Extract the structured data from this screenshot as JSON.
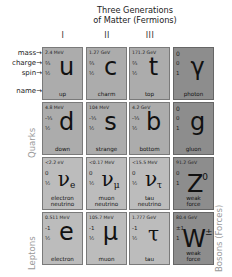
{
  "title": {
    "line1": "Three Generations",
    "line2": "of Matter (Fermions)"
  },
  "generations": [
    "I",
    "II",
    "III"
  ],
  "legend": {
    "mass": "mass→",
    "charge": "charge→",
    "spin": "spin→",
    "name": "name→"
  },
  "side_labels": {
    "quarks": "Quarks",
    "leptons": "Leptons",
    "bosons": "Bosons (Forces)"
  },
  "colors": {
    "quark_fill": "#acacac",
    "lepton_fill": "#bcbcbc",
    "boson_fill": "#8d8d8d",
    "side_label": "#9a9a9a"
  },
  "particles": {
    "row1": [
      {
        "mass": "2.4 MeV",
        "charge": "⅔",
        "spin": "½",
        "symbol": "u",
        "name1": "up",
        "name2": ""
      },
      {
        "mass": "1.27 GeV",
        "charge": "⅔",
        "spin": "½",
        "symbol": "c",
        "name1": "charm",
        "name2": ""
      },
      {
        "mass": "171.2 GeV",
        "charge": "⅔",
        "spin": "½",
        "symbol": "t",
        "name1": "top",
        "name2": ""
      },
      {
        "mass": "0",
        "charge": "0",
        "spin": "1",
        "symbol": "γ",
        "name1": "photon",
        "name2": ""
      }
    ],
    "row2": [
      {
        "mass": "4.8 MeV",
        "charge": "-⅓",
        "spin": "½",
        "symbol": "d",
        "name1": "down",
        "name2": ""
      },
      {
        "mass": "104 MeV",
        "charge": "-⅓",
        "spin": "½",
        "symbol": "s",
        "name1": "strange",
        "name2": ""
      },
      {
        "mass": "4.2 GeV",
        "charge": "-⅓",
        "spin": "½",
        "symbol": "b",
        "name1": "bottom",
        "name2": ""
      },
      {
        "mass": "0",
        "charge": "0",
        "spin": "1",
        "symbol": "g",
        "name1": "gluon",
        "name2": ""
      }
    ],
    "row3": [
      {
        "mass": "<2.2 eV",
        "charge": "0",
        "spin": "½",
        "symbol": "ν",
        "sub": "e",
        "name1": "electron",
        "name2": "neutrino"
      },
      {
        "mass": "<0.17 MeV",
        "charge": "0",
        "spin": "½",
        "symbol": "ν",
        "sub": "μ",
        "name1": "muon",
        "name2": "neutrino"
      },
      {
        "mass": "<15.5 MeV",
        "charge": "0",
        "spin": "½",
        "symbol": "ν",
        "sub": "τ",
        "name1": "tau",
        "name2": "neutrino"
      },
      {
        "mass": "91.2 GeV",
        "charge": "0",
        "spin": "1",
        "symbol": "Z",
        "sup": "0",
        "name1": "weak",
        "name2": "force"
      }
    ],
    "row4": [
      {
        "mass": "0.511 MeV",
        "charge": "-1",
        "spin": "½",
        "symbol": "e",
        "name1": "electron",
        "name2": ""
      },
      {
        "mass": "105.7 MeV",
        "charge": "-1",
        "spin": "½",
        "symbol": "μ",
        "name1": "muon",
        "name2": ""
      },
      {
        "mass": "1.777 GeV",
        "charge": "-1",
        "spin": "½",
        "symbol": "τ",
        "name1": "tau",
        "name2": ""
      },
      {
        "mass": "80.4 GeV",
        "charge": "±1",
        "spin": "1",
        "symbol": "W",
        "sup": "±",
        "name1": "weak",
        "name2": "force"
      }
    ]
  }
}
